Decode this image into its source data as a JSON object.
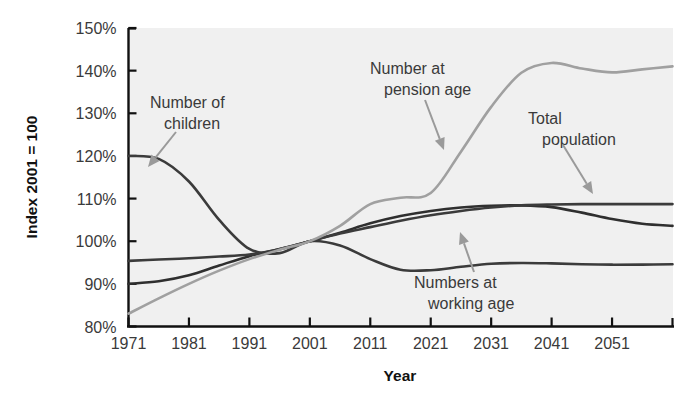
{
  "chart_data": {
    "type": "line",
    "title": "",
    "xlabel": "Year",
    "ylabel": "Index 2001 = 100",
    "xlim": [
      1971,
      2061
    ],
    "ylim": [
      80,
      150
    ],
    "grid": false,
    "legend_position": "inline-annotations",
    "x_ticks": [
      "1971",
      "1981",
      "1991",
      "2001",
      "2011",
      "2021",
      "2031",
      "2041",
      "2051"
    ],
    "x_tick_values": [
      1971,
      1981,
      1991,
      2001,
      2011,
      2021,
      2031,
      2041,
      2051
    ],
    "y_ticks": [
      "80%",
      "90%",
      "100%",
      "110%",
      "120%",
      "130%",
      "140%",
      "150%"
    ],
    "y_tick_values": [
      80,
      90,
      100,
      110,
      120,
      130,
      140,
      150
    ],
    "x": [
      1971,
      1976,
      1981,
      1986,
      1991,
      1996,
      2001,
      2006,
      2011,
      2016,
      2021,
      2026,
      2031,
      2036,
      2041,
      2046,
      2051,
      2056,
      2061
    ],
    "series": [
      {
        "name": "Number of children",
        "color": "#3b3b3b",
        "values": [
          120.0,
          119.3,
          114.0,
          105.0,
          98.2,
          97.2,
          100.0,
          99.0,
          95.8,
          93.3,
          93.2,
          94.0,
          94.7,
          94.9,
          94.8,
          94.6,
          94.5,
          94.5,
          94.6
        ]
      },
      {
        "name": "Numbers at working age",
        "color": "#2f2f2f",
        "values": [
          90.0,
          90.6,
          92.0,
          94.3,
          96.5,
          98.2,
          100.0,
          102.0,
          104.2,
          105.9,
          107.1,
          107.9,
          108.3,
          108.4,
          108.0,
          106.7,
          105.2,
          104.1,
          103.6
        ]
      },
      {
        "name": "Total population",
        "color": "#3b3b3b",
        "values": [
          95.4,
          95.7,
          96.0,
          96.4,
          96.9,
          98.1,
          100.0,
          101.8,
          103.3,
          104.8,
          106.1,
          107.1,
          107.9,
          108.4,
          108.6,
          108.7,
          108.7,
          108.7,
          108.7
        ]
      },
      {
        "name": "Number at pension age",
        "color": "#a0a0a0",
        "values": [
          83.0,
          86.6,
          90.0,
          93.1,
          95.8,
          98.0,
          100.0,
          103.6,
          108.7,
          110.2,
          111.3,
          121.0,
          131.5,
          139.5,
          141.8,
          140.5,
          139.6,
          140.3,
          141.0
        ]
      }
    ],
    "annotations": [
      {
        "id": "children",
        "text_lines": [
          "Number of",
          "children"
        ],
        "text_x": 150,
        "text_y": 108,
        "text_anchor": "start",
        "arrow_from": [
          176,
          132
        ],
        "arrow_to": [
          148,
          167
        ]
      },
      {
        "id": "pension",
        "text_lines": [
          "Number at",
          "pension age"
        ],
        "text_x": 370,
        "text_y": 74,
        "text_anchor": "start",
        "arrow_from": [
          425,
          100
        ],
        "arrow_to": [
          444,
          150
        ]
      },
      {
        "id": "total-population",
        "text_lines": [
          "Total",
          "population"
        ],
        "text_x": 528,
        "text_y": 124,
        "text_anchor": "start",
        "arrow_from": [
          563,
          145
        ],
        "arrow_to": [
          593,
          194
        ]
      },
      {
        "id": "working-age",
        "text_lines": [
          "Numbers at",
          "working age"
        ],
        "text_x": 414,
        "text_y": 288,
        "text_anchor": "start",
        "arrow_from": [
          474,
          272
        ],
        "arrow_to": [
          460,
          232
        ]
      }
    ],
    "colors": {
      "plot_background": "#f0f0f0",
      "axis": "#111111",
      "tick_text": "#3a3a3a",
      "annotation_text": "#3a3a3a",
      "dark_line": "#3b3b3b",
      "light_line": "#a0a0a0",
      "page_background": "#ffffff"
    }
  }
}
